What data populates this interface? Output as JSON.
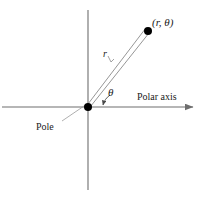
{
  "figure": {
    "background_color": "#ffffff",
    "line_color": "#6e6e6e",
    "text_color": "#1a1a1a",
    "marker_color": "#000000"
  },
  "labels": {
    "point": "(r, θ)",
    "radius": "r",
    "angle": "θ",
    "polar_axis": "Polar axis",
    "pole": "Pole"
  },
  "geometry": {
    "origin": {
      "x": 88,
      "y": 107
    },
    "point": {
      "x": 148,
      "y": 31
    },
    "horizontal_axis": {
      "x1": 2,
      "y1": 107,
      "x2": 197,
      "y2": 107,
      "arrow_end": "right"
    },
    "vertical_axis": {
      "x1": 88,
      "y1": 10,
      "x2": 88,
      "y2": 190,
      "arrow_end": "none"
    },
    "angle_degrees": 52
  }
}
